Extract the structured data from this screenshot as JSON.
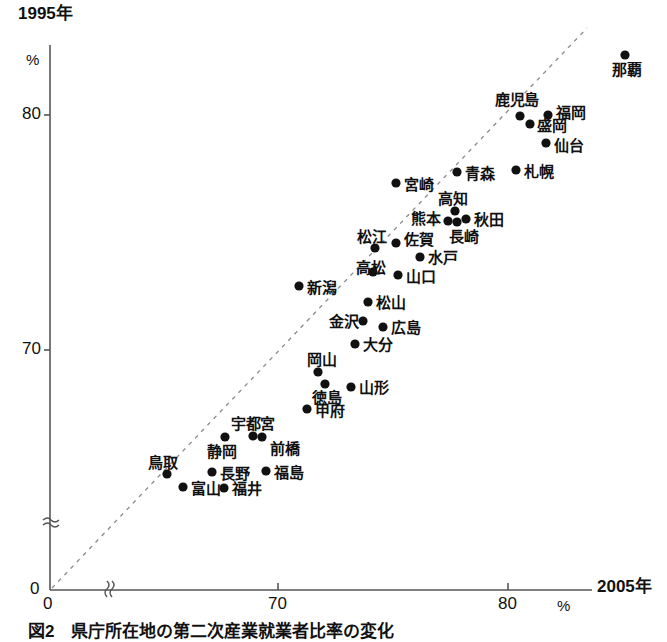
{
  "figure": {
    "caption": "図2　県庁所在地の第二次産業就業者比率の変化",
    "y_axis": {
      "title": "1995年",
      "unit": "%",
      "ticks": [
        "80",
        "70",
        "0"
      ]
    },
    "x_axis": {
      "title": "2005年",
      "unit": "%",
      "ticks": [
        "0",
        "70",
        "80"
      ]
    },
    "colors": {
      "axis": "#555555",
      "point": "#111111",
      "reference_line": "#888888",
      "text": "#111111"
    }
  },
  "chart_data": {
    "type": "scatter",
    "title": "図2　県庁所在地の第二次産業就業者比率の変化",
    "xlabel": "2005年",
    "ylabel": "1995年",
    "xunit": "%",
    "yunit": "%",
    "xlim": [
      66.5,
      82.5
    ],
    "ylim": [
      64.0,
      84.5
    ],
    "xticks": [
      70,
      80
    ],
    "yticks": [
      70,
      80
    ],
    "axis_break": true,
    "grid": false,
    "legend": null,
    "reference_line": {
      "label": "y = x",
      "style": "dashed",
      "color": "#888888"
    },
    "points": [
      {
        "label": "那覇",
        "x": 81.9,
        "y": 83.5
      },
      {
        "label": "鹿児島",
        "x": 79.1,
        "y": 79.9
      },
      {
        "label": "福岡",
        "x": 80.3,
        "y": 79.9
      },
      {
        "label": "盛岡",
        "x": 79.5,
        "y": 79.5
      },
      {
        "label": "仙台",
        "x": 80.2,
        "y": 78.5
      },
      {
        "label": "札幌",
        "x": 78.9,
        "y": 77.2
      },
      {
        "label": "青森",
        "x": 76.4,
        "y": 77.1
      },
      {
        "label": "宮崎",
        "x": 73.8,
        "y": 76.6
      },
      {
        "label": "高知",
        "x": 76.3,
        "y": 75.7
      },
      {
        "label": "秋田",
        "x": 76.8,
        "y": 75.3
      },
      {
        "label": "熊本",
        "x": 76.0,
        "y": 75.2
      },
      {
        "label": "長崎",
        "x": 76.3,
        "y": 75.1
      },
      {
        "label": "佐賀",
        "x": 74.0,
        "y": 74.3
      },
      {
        "label": "松江",
        "x": 73.1,
        "y": 74.1
      },
      {
        "label": "水戸",
        "x": 74.9,
        "y": 73.7
      },
      {
        "label": "高松",
        "x": 73.0,
        "y": 73.1
      },
      {
        "label": "山口",
        "x": 74.1,
        "y": 73.0
      },
      {
        "label": "新潟",
        "x": 70.0,
        "y": 72.5
      },
      {
        "label": "松山",
        "x": 72.8,
        "y": 72.0
      },
      {
        "label": "金沢",
        "x": 72.6,
        "y": 71.3
      },
      {
        "label": "広島",
        "x": 73.5,
        "y": 71.1
      },
      {
        "label": "大分",
        "x": 72.3,
        "y": 70.5
      },
      {
        "label": "岡山",
        "x": 70.7,
        "y": 69.4
      },
      {
        "label": "徳島",
        "x": 71.0,
        "y": 68.9
      },
      {
        "label": "山形",
        "x": 72.1,
        "y": 68.8
      },
      {
        "label": "甲府",
        "x": 69.9,
        "y": 67.9
      },
      {
        "label": "静岡",
        "x": 67.4,
        "y": 67.0
      },
      {
        "label": "宇都宮",
        "x": 68.6,
        "y": 67.0
      },
      {
        "label": "前橋",
        "x": 69.0,
        "y": 67.0
      },
      {
        "label": "鳥取",
        "x": 65.2,
        "y": 65.6
      },
      {
        "label": "長野",
        "x": 67.1,
        "y": 65.7
      },
      {
        "label": "福島",
        "x": 69.3,
        "y": 65.8
      },
      {
        "label": "富山",
        "x": 65.9,
        "y": 65.1
      },
      {
        "label": "福井",
        "x": 67.6,
        "y": 65.1
      }
    ]
  },
  "points_px": [
    {
      "label": "那覇",
      "px": 625,
      "py": 55,
      "lx": 612,
      "ly": 62,
      "anchor": "below"
    },
    {
      "label": "鹿児島",
      "px": 520,
      "py": 116,
      "lx": 495,
      "ly": 92,
      "anchor": "above-left"
    },
    {
      "label": "福岡",
      "px": 548,
      "py": 115,
      "lx": 556,
      "ly": 105,
      "anchor": "right"
    },
    {
      "label": "盛岡",
      "px": 530,
      "py": 124,
      "lx": 537,
      "ly": 118,
      "anchor": "right"
    },
    {
      "label": "仙台",
      "px": 546,
      "py": 143,
      "lx": 554,
      "ly": 138,
      "anchor": "right"
    },
    {
      "label": "札幌",
      "px": 516,
      "py": 170,
      "lx": 524,
      "ly": 164,
      "anchor": "right"
    },
    {
      "label": "青森",
      "px": 457,
      "py": 172,
      "lx": 465,
      "ly": 166,
      "anchor": "right"
    },
    {
      "label": "宮崎",
      "px": 396,
      "py": 183,
      "lx": 404,
      "ly": 177,
      "anchor": "right"
    },
    {
      "label": "高知",
      "px": 455,
      "py": 211,
      "lx": 438,
      "ly": 191,
      "anchor": "above-left"
    },
    {
      "label": "秋田",
      "px": 466,
      "py": 219,
      "lx": 474,
      "ly": 212,
      "anchor": "right"
    },
    {
      "label": "熊本",
      "px": 448,
      "py": 221,
      "lx": 411,
      "ly": 211,
      "anchor": "left"
    },
    {
      "label": "長崎",
      "px": 457,
      "py": 222,
      "lx": 449,
      "ly": 229,
      "anchor": "below"
    },
    {
      "label": "佐賀",
      "px": 396,
      "py": 243,
      "lx": 404,
      "ly": 232,
      "anchor": "right"
    },
    {
      "label": "松江",
      "px": 375,
      "py": 248,
      "lx": 357,
      "ly": 229,
      "anchor": "above-left"
    },
    {
      "label": "水戸",
      "px": 420,
      "py": 257,
      "lx": 428,
      "ly": 250,
      "anchor": "right"
    },
    {
      "label": "高松",
      "px": 373,
      "py": 272,
      "lx": 356,
      "ly": 260,
      "anchor": "above-left"
    },
    {
      "label": "山口",
      "px": 398,
      "py": 275,
      "lx": 406,
      "ly": 269,
      "anchor": "right"
    },
    {
      "label": "新潟",
      "px": 299,
      "py": 286,
      "lx": 307,
      "ly": 280,
      "anchor": "right"
    },
    {
      "label": "松山",
      "px": 368,
      "py": 302,
      "lx": 376,
      "ly": 295,
      "anchor": "right"
    },
    {
      "label": "金沢",
      "px": 363,
      "py": 321,
      "lx": 329,
      "ly": 314,
      "anchor": "left"
    },
    {
      "label": "広島",
      "px": 383,
      "py": 327,
      "lx": 391,
      "ly": 320,
      "anchor": "right"
    },
    {
      "label": "大分",
      "px": 355,
      "py": 344,
      "lx": 363,
      "ly": 337,
      "anchor": "right"
    },
    {
      "label": "岡山",
      "px": 318,
      "py": 372,
      "lx": 307,
      "ly": 352,
      "anchor": "above"
    },
    {
      "label": "徳島",
      "px": 325,
      "py": 384,
      "lx": 312,
      "ly": 390,
      "anchor": "below"
    },
    {
      "label": "山形",
      "px": 351,
      "py": 387,
      "lx": 359,
      "ly": 380,
      "anchor": "right"
    },
    {
      "label": "甲府",
      "px": 307,
      "py": 409,
      "lx": 315,
      "ly": 403,
      "anchor": "right"
    },
    {
      "label": "静岡",
      "px": 225,
      "py": 437,
      "lx": 207,
      "ly": 444,
      "anchor": "below"
    },
    {
      "label": "宇都宮",
      "px": 253,
      "py": 436,
      "lx": 231,
      "ly": 416,
      "anchor": "above"
    },
    {
      "label": "前橋",
      "px": 262,
      "py": 437,
      "lx": 270,
      "ly": 441,
      "anchor": "right"
    },
    {
      "label": "鳥取",
      "px": 167,
      "py": 474,
      "lx": 148,
      "ly": 455,
      "anchor": "above-left"
    },
    {
      "label": "長野",
      "px": 212,
      "py": 472,
      "lx": 220,
      "ly": 466,
      "anchor": "right"
    },
    {
      "label": "福島",
      "px": 266,
      "py": 471,
      "lx": 274,
      "ly": 465,
      "anchor": "right"
    },
    {
      "label": "富山",
      "px": 183,
      "py": 487,
      "lx": 191,
      "ly": 481,
      "anchor": "right"
    },
    {
      "label": "福井",
      "px": 224,
      "py": 488,
      "lx": 232,
      "ly": 481,
      "anchor": "right"
    }
  ],
  "axis_px": {
    "y_title": {
      "text": "1995年",
      "x": 18,
      "y": 5
    },
    "y_unit": {
      "text": "%",
      "x": 26,
      "y": 52
    },
    "y_tick_80": {
      "text": "80",
      "x": 22,
      "y": 107
    },
    "y_tick_70": {
      "text": "70",
      "x": 22,
      "y": 342
    },
    "origin_y": {
      "text": "0",
      "x": 30,
      "y": 581
    },
    "x_tick_70": {
      "text": "70",
      "x": 268,
      "y": 596
    },
    "x_tick_80": {
      "text": "80",
      "x": 498,
      "y": 596
    },
    "x_unit": {
      "text": "%",
      "x": 557,
      "y": 598
    },
    "x_title": {
      "text": "2005年",
      "x": 597,
      "y": 578
    },
    "origin_x": {
      "text": "0",
      "x": 43,
      "y": 596
    }
  }
}
